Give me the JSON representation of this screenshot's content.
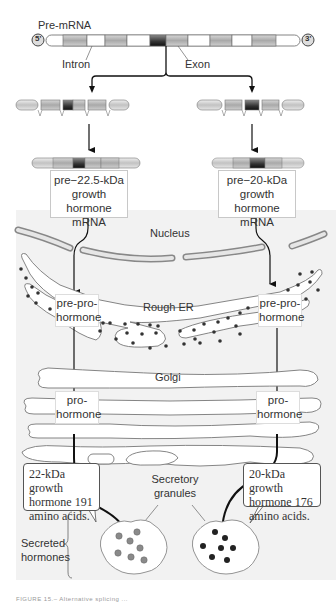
{
  "premrna": {
    "label": "Pre-mRNA",
    "five_prime": "5'",
    "three_prime": "3'",
    "intron_label": "Intron",
    "exon_label": "Exon"
  },
  "left_path": {
    "mrna_box": [
      "pre−22.5-kDa",
      "growth hormone",
      "mRNA"
    ],
    "er_box": [
      "pre-pro-",
      "hormone"
    ],
    "golgi_box": [
      "pro-",
      "hormone"
    ],
    "product_box": [
      "22-kDa growth",
      "hormone 191",
      "amino acids."
    ],
    "granule_dot_color": "#8a8a8a"
  },
  "right_path": {
    "mrna_box": [
      "pre−20-kDa",
      "growth hormone",
      "mRNA"
    ],
    "er_box": [
      "pre-pro-",
      "hormone"
    ],
    "golgi_box": [
      "pro-",
      "hormone"
    ],
    "product_box": [
      "20-kDa growth",
      "hormone 176",
      "amino acids."
    ],
    "granule_dot_color": "#222222"
  },
  "organelles": {
    "nucleus": "Nucleus",
    "rough_er": "Rough ER",
    "golgi": "Golgi",
    "granules": [
      "Secretory",
      "granules"
    ],
    "secreted": [
      "Secreted",
      "hormones"
    ]
  },
  "caption": "FIGURE 15.– Alternative splicing ..."
}
